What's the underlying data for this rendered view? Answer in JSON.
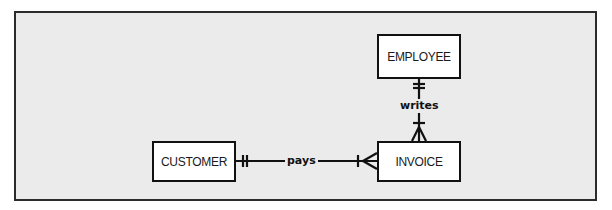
{
  "diagram": {
    "type": "entity-relationship",
    "notation": "crow's foot",
    "colors": {
      "background_outer": "#ffffff",
      "background_frame": "#ebebeb",
      "frame_border": "#2b2b2b",
      "entity_fill": "#ffffff",
      "line": "#111111",
      "text": "#1a1a1a"
    },
    "entities": [
      {
        "id": "employee",
        "label": "EMPLOYEE"
      },
      {
        "id": "invoice",
        "label": "INVOICE"
      },
      {
        "id": "customer",
        "label": "CUSTOMER"
      }
    ],
    "relationships": [
      {
        "id": "writes",
        "label": "writes",
        "from": "EMPLOYEE",
        "to": "INVOICE",
        "from_cardinality": "one and only one",
        "to_cardinality": "one or many"
      },
      {
        "id": "pays",
        "label": "pays",
        "from": "CUSTOMER",
        "to": "INVOICE",
        "from_cardinality": "one and only one",
        "to_cardinality": "one or many"
      }
    ]
  }
}
